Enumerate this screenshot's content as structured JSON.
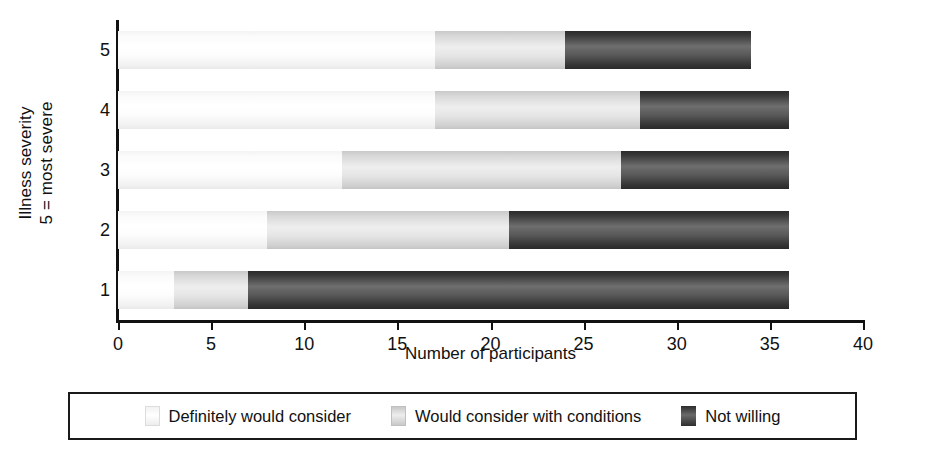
{
  "chart_data": {
    "type": "bar",
    "orientation": "horizontal",
    "stacked": true,
    "title": "",
    "xlabel": "Number of participants",
    "ylabel_line1": "Illness severity",
    "ylabel_line2": "5 = most severe",
    "categories": [
      "1",
      "2",
      "3",
      "4",
      "5"
    ],
    "category_order_top_to_bottom": [
      "5",
      "4",
      "3",
      "2",
      "1"
    ],
    "xlim": [
      0,
      40
    ],
    "xticks": [
      0,
      5,
      10,
      15,
      20,
      25,
      30,
      35,
      40
    ],
    "xtick_labels": [
      "0",
      "5",
      "10",
      "15",
      "20",
      "25",
      "30",
      "35",
      "40"
    ],
    "grid": false,
    "legend_position": "bottom",
    "series": [
      {
        "name": "Definitely would consider",
        "color": "#ffffff",
        "values": [
          3,
          8,
          12,
          17,
          17
        ]
      },
      {
        "name": "Would consider with conditions",
        "color": "#e6e6e6",
        "values": [
          4,
          13,
          15,
          11,
          7
        ]
      },
      {
        "name": "Not willing",
        "color": "#4a4a4a",
        "values": [
          29,
          15,
          9,
          8,
          10
        ]
      }
    ],
    "totals": [
      36,
      36,
      36,
      36,
      34
    ]
  },
  "legend": {
    "items": [
      {
        "label": "Definitely would consider",
        "swatch": "s0"
      },
      {
        "label": "Would consider with conditions",
        "swatch": "s1"
      },
      {
        "label": "Not willing",
        "swatch": "s2"
      }
    ]
  }
}
